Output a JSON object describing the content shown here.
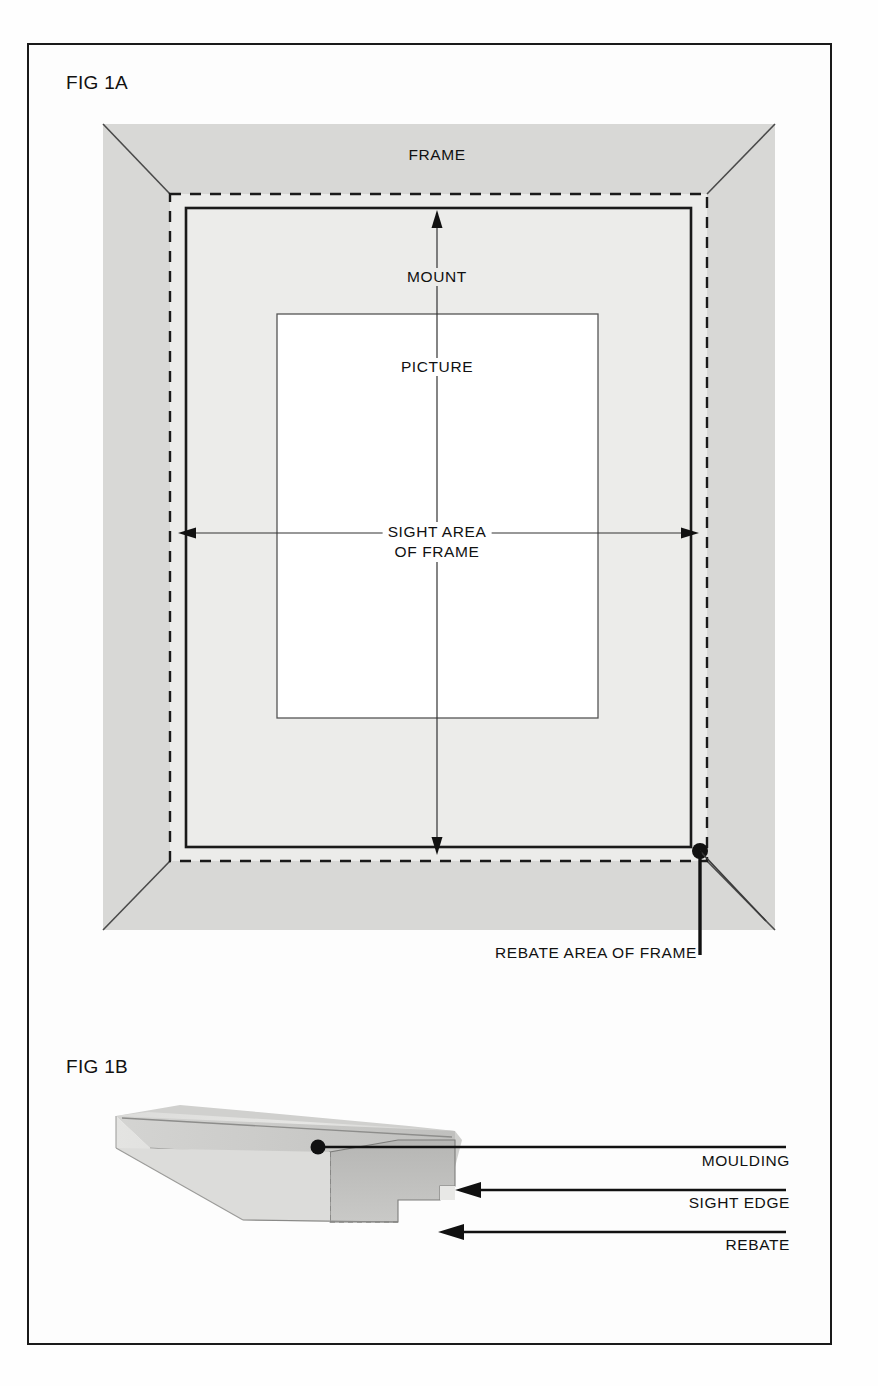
{
  "figure": {
    "fig_a_label": "FIG 1A",
    "fig_b_label": "FIG 1B"
  },
  "fig_a": {
    "labels": {
      "frame": "FRAME",
      "mount": "MOUNT",
      "picture": "PICTURE",
      "sight_area_line1": "SIGHT AREA",
      "sight_area_line2": "OF FRAME",
      "rebate_area": "REBATE AREA OF FRAME"
    },
    "regions": {
      "frame_fill": "#d8d8d6",
      "mount_fill": "#ececea",
      "picture_fill": "#ffffff",
      "rebate_line_style": "dashed",
      "outline_color": "#1a1a1a"
    }
  },
  "fig_b": {
    "labels": {
      "moulding": "MOULDING",
      "sight_edge": "SIGHT EDGE",
      "rebate": "REBATE"
    },
    "colors": {
      "moulding_top": "#e2e2e0",
      "moulding_face": "#d2d2d0",
      "moulding_end": "#b9b9b7",
      "moulding_shadow": "#c4c4c2"
    }
  }
}
